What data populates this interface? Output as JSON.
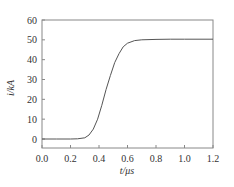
{
  "chart_data": {
    "type": "line",
    "title": "",
    "xlabel": "t/μs",
    "ylabel": "i/kA",
    "xlim": [
      0.0,
      1.2
    ],
    "ylim": [
      -5,
      60
    ],
    "x_ticks": [
      "0.0",
      "0.2",
      "0.4",
      "0.6",
      "0.8",
      "1.0",
      "1.2"
    ],
    "y_ticks": [
      "0",
      "10",
      "20",
      "30",
      "40",
      "50",
      "60"
    ],
    "grid": false,
    "legend": null,
    "series": [
      {
        "name": "i",
        "x": [
          0.0,
          0.1,
          0.2,
          0.25,
          0.3,
          0.33,
          0.36,
          0.39,
          0.42,
          0.45,
          0.48,
          0.51,
          0.54,
          0.57,
          0.6,
          0.65,
          0.7,
          0.8,
          0.9,
          1.0,
          1.2
        ],
        "y": [
          0.0,
          0.0,
          0.0,
          0.1,
          0.6,
          2.0,
          5.0,
          10.0,
          17.0,
          25.0,
          32.0,
          38.5,
          43.0,
          46.5,
          48.3,
          49.6,
          50.0,
          50.2,
          50.3,
          50.3,
          50.3
        ]
      }
    ],
    "colors": {
      "line": "#555555",
      "frame": "#888888",
      "text": "#333333"
    }
  }
}
